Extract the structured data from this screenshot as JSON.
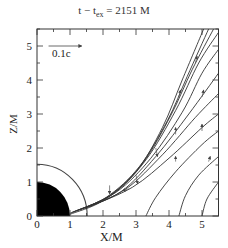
{
  "chart_data": {
    "type": "line",
    "title_parts": {
      "prefix": "t − t",
      "sub": "ex",
      "suffix": " = 2151 M"
    },
    "xlabel": "X/M",
    "ylabel": "Z/M",
    "xlim": [
      0,
      5.5
    ],
    "ylim": [
      0,
      5.5
    ],
    "xticks": [
      0,
      1,
      2,
      3,
      4,
      5
    ],
    "yticks": [
      0,
      1,
      2,
      3,
      4,
      5
    ],
    "grid": false,
    "velocity_scale_label": "0.1c",
    "velocity_scale_arrow": {
      "x0": 0.35,
      "x1": 1.35,
      "z": 5.0
    },
    "black_hole": {
      "radius": 1.0,
      "fill": "#000000"
    },
    "outer_arc": {
      "radius": 1.52
    },
    "field_lines": [
      {
        "name": "line1",
        "points": [
          [
            1.0,
            0.05
          ],
          [
            2.0,
            0.45
          ],
          [
            3.0,
            1.3
          ],
          [
            3.8,
            2.6
          ],
          [
            4.4,
            4.0
          ],
          [
            5.05,
            5.5
          ]
        ]
      },
      {
        "name": "line2",
        "points": [
          [
            1.0,
            0.08
          ],
          [
            2.1,
            0.55
          ],
          [
            3.1,
            1.45
          ],
          [
            3.95,
            2.8
          ],
          [
            4.55,
            4.1
          ],
          [
            5.2,
            5.5
          ]
        ]
      },
      {
        "name": "line3",
        "points": [
          [
            1.05,
            0.1
          ],
          [
            2.2,
            0.6
          ],
          [
            3.2,
            1.55
          ],
          [
            4.05,
            2.95
          ],
          [
            4.7,
            4.3
          ],
          [
            5.35,
            5.5
          ]
        ]
      },
      {
        "name": "line4",
        "points": [
          [
            1.1,
            0.12
          ],
          [
            2.3,
            0.65
          ],
          [
            3.3,
            1.65
          ],
          [
            4.2,
            3.1
          ],
          [
            4.9,
            4.5
          ],
          [
            5.5,
            5.4
          ]
        ]
      },
      {
        "name": "line5",
        "points": [
          [
            1.2,
            0.15
          ],
          [
            2.4,
            0.7
          ],
          [
            3.45,
            1.7
          ],
          [
            4.4,
            3.05
          ],
          [
            5.0,
            4.2
          ],
          [
            5.5,
            4.9
          ]
        ]
      },
      {
        "name": "line6",
        "points": [
          [
            1.3,
            0.18
          ],
          [
            2.55,
            0.72
          ],
          [
            3.6,
            1.75
          ],
          [
            4.6,
            3.0
          ],
          [
            5.5,
            4.2
          ]
        ]
      },
      {
        "name": "line7",
        "points": [
          [
            1.45,
            0.22
          ],
          [
            2.7,
            0.8
          ],
          [
            3.8,
            1.8
          ],
          [
            4.8,
            2.9
          ],
          [
            5.5,
            3.6
          ]
        ]
      },
      {
        "name": "line8",
        "points": [
          [
            1.6,
            0.28
          ],
          [
            2.9,
            0.85
          ],
          [
            4.0,
            1.7
          ],
          [
            5.0,
            2.6
          ],
          [
            5.5,
            3.0
          ]
        ]
      },
      {
        "name": "line9",
        "points": [
          [
            3.3,
            0.0
          ],
          [
            3.6,
            0.55
          ],
          [
            4.2,
            1.3
          ],
          [
            5.0,
            2.1
          ],
          [
            5.5,
            2.5
          ]
        ]
      },
      {
        "name": "line10",
        "points": [
          [
            4.3,
            0.0
          ],
          [
            4.5,
            0.6
          ],
          [
            4.9,
            1.2
          ],
          [
            5.5,
            1.75
          ]
        ]
      },
      {
        "name": "line11",
        "points": [
          [
            5.0,
            0.0
          ],
          [
            5.15,
            0.5
          ],
          [
            5.5,
            1.0
          ]
        ]
      }
    ],
    "velocity_arrows": [
      {
        "x": 2.2,
        "z": 0.9,
        "dx": 0.0,
        "dz": -0.25
      },
      {
        "x": 3.0,
        "z": 1.2,
        "dx": 0.05,
        "dz": -0.25
      },
      {
        "x": 3.6,
        "z": 2.0,
        "dx": 0.05,
        "dz": -0.25
      },
      {
        "x": 2.8,
        "z": 0.8,
        "dx": -0.2,
        "dz": -0.05
      },
      {
        "x": 4.3,
        "z": 3.5,
        "dx": 0.05,
        "dz": 0.2
      },
      {
        "x": 4.8,
        "z": 4.5,
        "dx": 0.05,
        "dz": 0.2
      },
      {
        "x": 5.0,
        "z": 3.5,
        "dx": 0.05,
        "dz": 0.2
      },
      {
        "x": 5.0,
        "z": 2.5,
        "dx": 0.0,
        "dz": 0.2
      },
      {
        "x": 4.2,
        "z": 2.4,
        "dx": 0.0,
        "dz": 0.2
      },
      {
        "x": 4.2,
        "z": 1.6,
        "dx": 0.0,
        "dz": 0.15
      },
      {
        "x": 5.2,
        "z": 1.6,
        "dx": 0.05,
        "dz": 0.15
      }
    ]
  }
}
